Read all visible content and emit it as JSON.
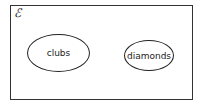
{
  "diagram": {
    "type": "venn",
    "universal_set_symbol": "ℰ",
    "sets": [
      {
        "label": "clubs"
      },
      {
        "label": "diamonds"
      }
    ]
  }
}
